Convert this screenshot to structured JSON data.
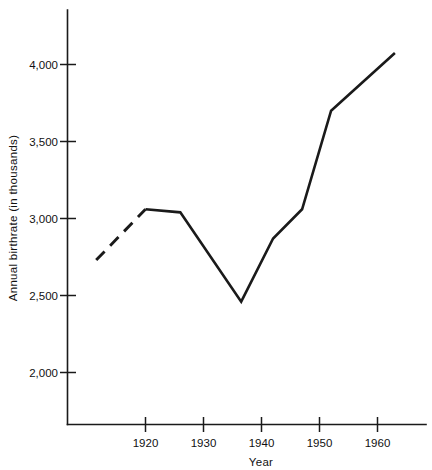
{
  "chart_data": {
    "type": "line",
    "title": "",
    "xlabel": "Year",
    "ylabel": "Annual birthrate (in thousands)",
    "xlim": [
      1911,
      1966
    ],
    "ylim": [
      1830,
      4200
    ],
    "grid": false,
    "legend": "none",
    "x_ticks": [
      1920,
      1930,
      1940,
      1950,
      1960
    ],
    "x_tick_labels": [
      "1920",
      "1930",
      "1940",
      "1950",
      "1960"
    ],
    "y_ticks": [
      2000,
      2500,
      3000,
      3500,
      4000
    ],
    "y_tick_labels": [
      "2,000",
      "2,500",
      "3,000",
      "3,500",
      "4,000"
    ],
    "series": [
      {
        "name": "estimated-birthrate",
        "style": "dashed",
        "x": [
          1911.5,
          1920
        ],
        "values": [
          2730,
          3060
        ]
      },
      {
        "name": "annual-birthrate",
        "style": "solid",
        "x": [
          1920,
          1926,
          1936.5,
          1942,
          1947,
          1952,
          1963
        ],
        "values": [
          3060,
          3040,
          2460,
          2870,
          3060,
          3700,
          4075
        ]
      }
    ],
    "colors": {
      "line": "#1a1a1a",
      "axis": "#1a1a1a",
      "background": "#ffffff"
    }
  }
}
